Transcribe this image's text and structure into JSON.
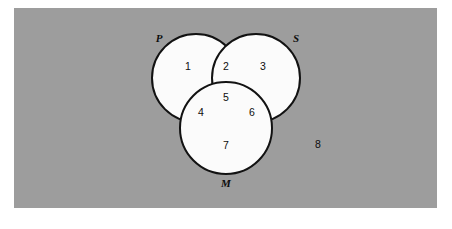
{
  "figure": {
    "background_color": "#9d9d9d",
    "page_color": "#ffffff",
    "circle_fill_color": "#fbfbfb",
    "outline_color": "#121212",
    "text_color": "#0d0d0d"
  },
  "panel": {
    "x": 14,
    "y": 8,
    "width": 423,
    "height": 200
  },
  "sets": [
    {
      "key": "P",
      "label": "P",
      "cx": 196,
      "cy": 78,
      "r": 44,
      "label_x": 159,
      "label_y": 39
    },
    {
      "key": "S",
      "label": "S",
      "cx": 256,
      "cy": 78,
      "r": 44,
      "label_x": 296,
      "label_y": 39
    },
    {
      "key": "M",
      "label": "M",
      "cx": 226,
      "cy": 128,
      "r": 46,
      "label_x": 226,
      "label_y": 184
    }
  ],
  "regions": [
    {
      "id": "p-only",
      "label": "1",
      "description": "P only",
      "x": 188,
      "y": 67
    },
    {
      "id": "p-s",
      "label": "2",
      "description": "P and S",
      "x": 226,
      "y": 67
    },
    {
      "id": "s-only",
      "label": "3",
      "description": "S only",
      "x": 263,
      "y": 67
    },
    {
      "id": "p-m",
      "label": "4",
      "description": "P and M",
      "x": 201,
      "y": 113
    },
    {
      "id": "p-s-m",
      "label": "5",
      "description": "P and S and M",
      "x": 226,
      "y": 98
    },
    {
      "id": "s-m",
      "label": "6",
      "description": "S and M",
      "x": 252,
      "y": 113
    },
    {
      "id": "m-only",
      "label": "7",
      "description": "M only",
      "x": 226,
      "y": 146
    },
    {
      "id": "universe",
      "label": "8",
      "description": "outside all sets",
      "x": 318,
      "y": 145
    }
  ]
}
